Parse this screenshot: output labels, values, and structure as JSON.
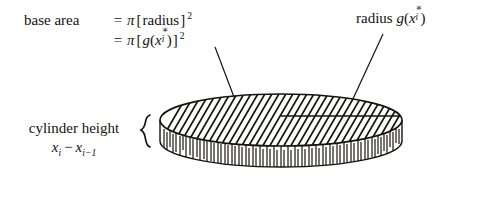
{
  "figure": {
    "background_color": "#ffffff",
    "ink_color": "#15120f"
  },
  "labels": {
    "base_area": {
      "lhs": "base area",
      "equals": "=",
      "line1_rhs_pi": "π",
      "line1_rhs_open": "[",
      "line1_rhs_inner": "radius",
      "line1_rhs_close": "]",
      "line1_exponent": "2",
      "line2_rhs_pi": "π",
      "line2_rhs_open": "[",
      "line2_fn": "g",
      "line2_paren_open": "(",
      "line2_var": "x",
      "line2_star": "∗",
      "line2_sub": "i",
      "line2_paren_close": ")",
      "line2_rhs_close": "]",
      "line2_exponent": "2"
    },
    "radius": {
      "text": "radius",
      "fn": "g",
      "paren_open": "(",
      "var": "x",
      "star": "∗",
      "sub": "i",
      "paren_close": ")"
    },
    "cylinder_height": {
      "line1": "cylinder height",
      "var": "x",
      "sub1": "i",
      "minus": "−",
      "var2": "x",
      "sub2": "i−1",
      "brace": "{"
    }
  },
  "geometry": {
    "ellipse_center_x": 281,
    "ellipse_center_y": 120,
    "ellipse_rx": 121,
    "ellipse_ry": 26,
    "side_height": 42,
    "radius_line": {
      "x1": 281,
      "y1": 116,
      "x2": 400,
      "y2": 116
    },
    "leader_base_area": {
      "x1": 215,
      "y1": 47,
      "x2": 234,
      "y2": 97
    },
    "leader_radius": {
      "x1": 383,
      "y1": 34,
      "x2": 352,
      "y2": 101
    },
    "brace": {
      "x": 142,
      "y_top": 116,
      "y_bottom": 166
    },
    "top_hatch_angle_deg": 60,
    "top_hatch_count": 44,
    "side_hatch_count": 78
  }
}
